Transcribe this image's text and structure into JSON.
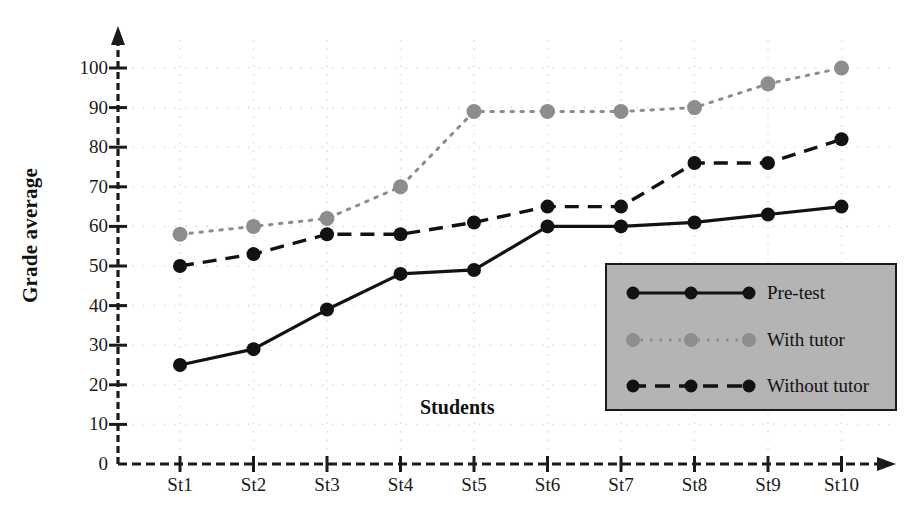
{
  "chart_data": {
    "type": "line",
    "title": "",
    "xlabel": "Students",
    "ylabel": "Grade average",
    "categories": [
      "St1",
      "St2",
      "St3",
      "St4",
      "St5",
      "St6",
      "St7",
      "St8",
      "St9",
      "St10"
    ],
    "ylim": [
      0,
      100
    ],
    "yticks": [
      0,
      10,
      20,
      30,
      40,
      50,
      60,
      70,
      80,
      90,
      100
    ],
    "grid": true,
    "legend_position": "inside-bottom-right",
    "series": [
      {
        "name": "Pre-test",
        "style": "solid",
        "color": "#121212",
        "marker": "circle",
        "values": [
          25,
          29,
          39,
          48,
          49,
          60,
          60,
          61,
          63,
          65
        ]
      },
      {
        "name": "With tutor",
        "style": "dotted",
        "color": "#8d8d8d",
        "marker": "circle",
        "values": [
          58,
          60,
          62,
          70,
          89,
          89,
          89,
          90,
          96,
          100
        ]
      },
      {
        "name": "Without tutor",
        "style": "dashed",
        "color": "#121212",
        "marker": "circle",
        "values": [
          50,
          53,
          58,
          58,
          61,
          65,
          65,
          76,
          76,
          82
        ]
      }
    ]
  },
  "axis": {
    "y_tick_labels": [
      "0",
      "10",
      "20",
      "30",
      "40",
      "50",
      "60",
      "70",
      "80",
      "90",
      "100"
    ],
    "x_tick_labels": [
      "St1",
      "St2",
      "St3",
      "St4",
      "St5",
      "St6",
      "St7",
      "St8",
      "St9",
      "St10"
    ],
    "y_title": "Grade average",
    "x_title": "Students"
  },
  "legend": {
    "items": [
      {
        "label": "Pre-test"
      },
      {
        "label": "With tutor"
      },
      {
        "label": "Without tutor"
      }
    ]
  },
  "colors": {
    "pre_test": "#121212",
    "with_tutor": "#8d8d8d",
    "without_tutor": "#121212",
    "legend_background": "#b4b4b4",
    "axis": "#1a1a1a",
    "grid": "#dedede",
    "page_background": "#ffffff"
  }
}
